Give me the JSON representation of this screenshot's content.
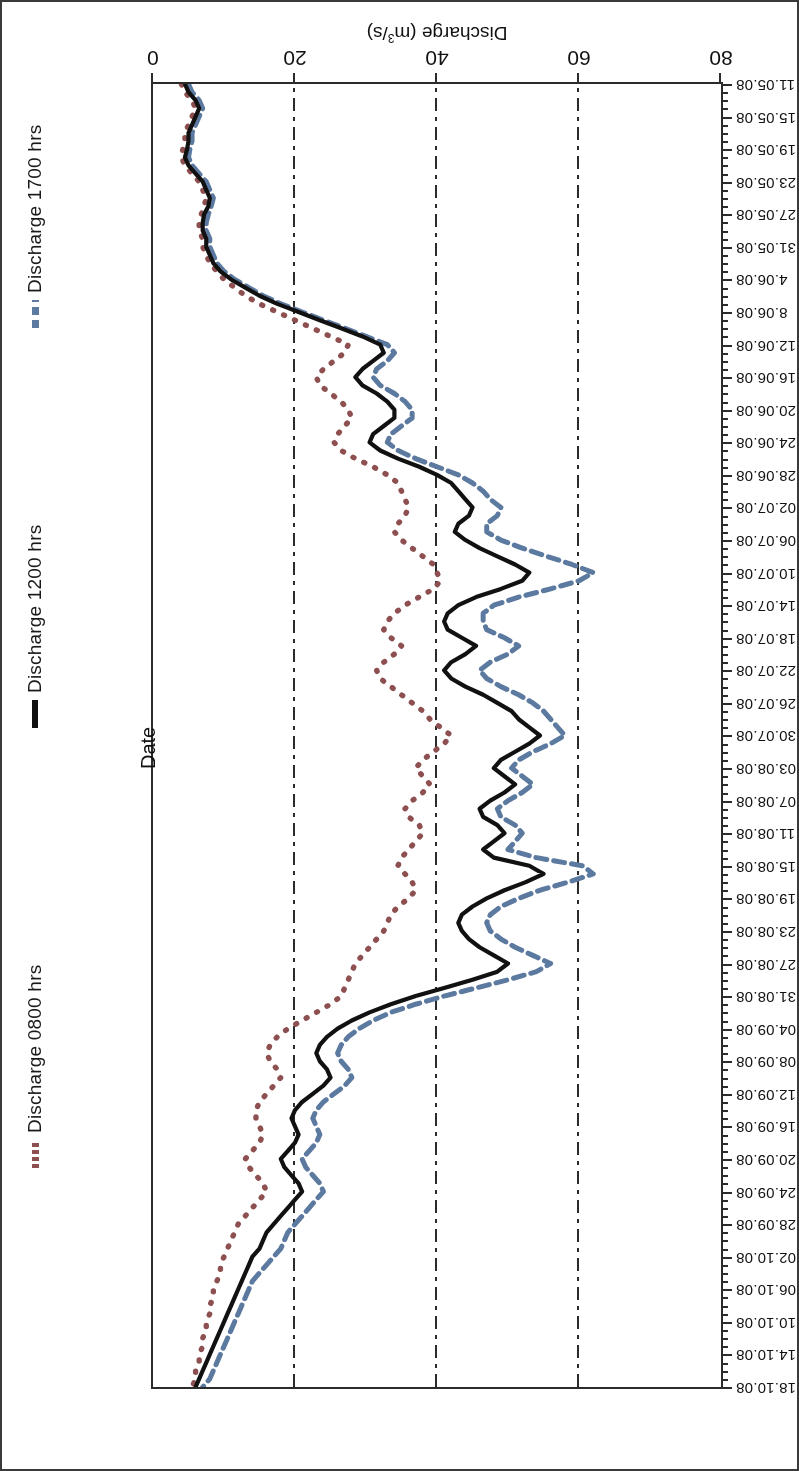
{
  "chart_data": {
    "type": "line",
    "title": "",
    "xlabel": "Date",
    "ylabel": "Discharge (m³/s)",
    "ylim": [
      0,
      80
    ],
    "yticks": [
      0,
      20,
      40,
      60,
      80
    ],
    "grid": true,
    "gridlines_at": [
      20,
      40,
      60
    ],
    "legend_position": "top",
    "orientation": "rotated-180",
    "x": [
      "11.05.08",
      "12.05.08",
      "13.05.08",
      "14.05.08",
      "15.05.08",
      "16.05.08",
      "17.05.08",
      "18.05.08",
      "19.05.08",
      "20.05.08",
      "21.05.08",
      "22.05.08",
      "23.05.08",
      "24.05.08",
      "25.05.08",
      "26.05.08",
      "27.05.08",
      "28.05.08",
      "29.05.08",
      "30.05.08",
      "31.05.08",
      "01.06.08",
      "02.06.08",
      "03.06.08",
      "04.06.08",
      "05.06.08",
      "06.06.08",
      "07.06.08",
      "08.06.08",
      "09.06.08",
      "10.06.08",
      "11.06.08",
      "12.06.08",
      "13.06.08",
      "14.06.08",
      "15.06.08",
      "16.06.08",
      "17.06.08",
      "18.06.08",
      "19.06.08",
      "20.06.08",
      "21.06.08",
      "22.06.08",
      "23.06.08",
      "24.06.08",
      "25.06.08",
      "26.06.08",
      "27.06.08",
      "28.06.08",
      "29.06.08",
      "30.06.08",
      "01.07.08",
      "02.07.08",
      "03.07.08",
      "04.07.08",
      "05.07.08",
      "06.07.08",
      "07.07.08",
      "08.07.08",
      "09.07.08",
      "10.07.08",
      "11.07.08",
      "12.07.08",
      "13.07.08",
      "14.07.08",
      "15.07.08",
      "16.07.08",
      "17.07.08",
      "18.07.08",
      "19.07.08",
      "20.07.08",
      "21.07.08",
      "22.07.08",
      "23.07.08",
      "24.07.08",
      "25.07.08",
      "26.07.08",
      "27.07.08",
      "28.07.08",
      "29.07.08",
      "30.07.08",
      "31.07.08",
      "01.08.08",
      "02.08.08",
      "03.08.08",
      "04.08.08",
      "05.08.08",
      "06.08.08",
      "07.08.08",
      "08.08.08",
      "09.08.08",
      "10.08.08",
      "11.08.08",
      "12.08.08",
      "13.08.08",
      "14.08.08",
      "15.08.08",
      "16.08.08",
      "17.08.08",
      "18.08.08",
      "19.08.08",
      "20.08.08",
      "21.08.08",
      "22.08.08",
      "23.08.08",
      "24.08.08",
      "25.08.08",
      "26.08.08",
      "27.08.08",
      "28.08.08",
      "29.08.08",
      "30.08.08",
      "31.08.08",
      "01.09.08",
      "02.09.08",
      "03.09.08",
      "04.09.08",
      "05.09.08",
      "06.09.08",
      "07.09.08",
      "08.09.08",
      "09.09.08",
      "10.09.08",
      "11.09.08",
      "12.09.08",
      "13.09.08",
      "14.09.08",
      "15.09.08",
      "16.09.08",
      "17.09.08",
      "18.09.08",
      "19.09.08",
      "20.09.08",
      "21.09.08",
      "22.09.08",
      "23.09.08",
      "24.09.08",
      "25.09.08",
      "26.09.08",
      "27.09.08",
      "28.09.08",
      "29.09.08",
      "30.09.08",
      "01.10.08",
      "02.10.08",
      "03.10.08",
      "04.10.08",
      "05.10.08",
      "06.10.08",
      "07.10.08",
      "08.10.08",
      "09.10.08",
      "10.10.08",
      "11.10.08",
      "12.10.08",
      "13.10.08",
      "14.10.08",
      "15.10.08",
      "16.10.08",
      "17.10.08",
      "18.10.08"
    ],
    "xtick_labels": [
      "11.05.08",
      "15.05.08",
      "19.05.08",
      "23.05.08",
      "27.05.08",
      "31.05.08",
      "4.06.08",
      "8.06.08",
      "12.06.08",
      "16.06.08",
      "20.06.08",
      "24.06.08",
      "28.06.08",
      "02.07.08",
      "06.07.08",
      "10.07.08",
      "14.07.08",
      "18.07.08",
      "22.07.08",
      "26.07.08",
      "30.07.08",
      "03.08.08",
      "07.08.08",
      "11.08.08",
      "15.08.08",
      "19.08.08",
      "23.08.08",
      "27.08.08",
      "31.08.08",
      "04.09.08",
      "08.09.08",
      "12.09.08",
      "16.09.08",
      "20.09.08",
      "24.09.08",
      "28.09.08",
      "02.10.08",
      "06.10.08",
      "10.10.08",
      "14.10.08",
      "18.10.08"
    ],
    "series": [
      {
        "name": "Discharge 0800 hrs",
        "color": "#8d4f4f",
        "style": "dotted",
        "values": [
          4.0,
          4.5,
          5.5,
          6.0,
          5.5,
          5.0,
          4.5,
          4.5,
          4.2,
          4.0,
          4.5,
          5.5,
          6.5,
          7.0,
          7.5,
          7.2,
          6.8,
          6.5,
          6.5,
          7.0,
          7.0,
          7.5,
          8.0,
          9.0,
          10.0,
          11.5,
          13.0,
          15.0,
          17.5,
          20.0,
          22.5,
          25.0,
          27.5,
          27.0,
          25.5,
          24.0,
          23.0,
          23.5,
          25.0,
          26.5,
          27.5,
          28.0,
          27.0,
          26.0,
          25.5,
          26.5,
          28.5,
          31.0,
          33.0,
          34.5,
          35.0,
          35.5,
          36.0,
          35.5,
          34.5,
          34.0,
          35.0,
          36.5,
          38.0,
          39.5,
          40.0,
          40.5,
          39.5,
          37.5,
          35.5,
          34.0,
          33.0,
          32.5,
          33.5,
          35.0,
          34.0,
          32.5,
          31.5,
          32.0,
          33.5,
          35.0,
          36.5,
          38.0,
          39.0,
          40.5,
          42.0,
          41.0,
          39.5,
          38.0,
          37.0,
          38.0,
          39.0,
          38.0,
          36.5,
          35.5,
          36.0,
          37.5,
          38.0,
          37.0,
          36.0,
          35.0,
          34.5,
          35.5,
          36.5,
          37.0,
          36.0,
          34.5,
          33.5,
          33.0,
          32.5,
          31.5,
          30.5,
          29.5,
          28.5,
          28.0,
          27.5,
          27.0,
          26.5,
          25.0,
          23.0,
          21.0,
          19.0,
          17.5,
          16.5,
          16.0,
          16.5,
          17.5,
          18.0,
          17.0,
          16.0,
          15.0,
          14.5,
          14.5,
          15.0,
          15.5,
          15.0,
          14.0,
          13.0,
          13.5,
          14.5,
          15.5,
          16.0,
          15.0,
          14.0,
          13.0,
          12.0,
          11.5,
          11.0,
          10.5,
          10.0,
          9.5,
          9.5,
          9.0,
          8.5,
          8.5,
          8.0,
          8.0,
          7.5,
          7.5,
          7.0,
          7.0,
          6.5,
          6.5,
          6.0,
          6.0,
          5.5
        ]
      },
      {
        "name": "Discharge 1200 hrs",
        "color": "#111111",
        "style": "solid",
        "values": [
          4.5,
          5.0,
          6.0,
          6.5,
          6.0,
          5.5,
          5.0,
          5.0,
          4.8,
          4.5,
          5.0,
          6.0,
          7.0,
          7.5,
          8.0,
          7.8,
          7.2,
          7.0,
          7.0,
          7.5,
          7.5,
          8.0,
          8.5,
          9.5,
          11.0,
          13.0,
          15.0,
          17.5,
          20.5,
          23.5,
          26.5,
          29.5,
          32.0,
          32.5,
          31.0,
          29.5,
          28.5,
          29.5,
          31.5,
          33.0,
          34.0,
          34.0,
          32.5,
          31.0,
          30.5,
          32.0,
          34.5,
          37.5,
          40.0,
          42.0,
          43.0,
          44.0,
          45.0,
          44.5,
          43.0,
          42.5,
          44.0,
          46.0,
          48.5,
          51.0,
          53.0,
          52.0,
          49.0,
          45.5,
          43.0,
          41.5,
          41.0,
          41.5,
          43.5,
          45.5,
          44.0,
          42.0,
          41.0,
          42.0,
          44.0,
          46.5,
          48.5,
          50.5,
          51.5,
          53.0,
          54.5,
          53.0,
          51.0,
          49.0,
          48.0,
          49.5,
          51.0,
          49.5,
          47.5,
          46.0,
          46.5,
          48.5,
          49.5,
          48.0,
          46.5,
          48.0,
          53.0,
          55.0,
          52.5,
          49.5,
          47.0,
          45.0,
          43.5,
          43.0,
          43.5,
          44.5,
          46.0,
          48.0,
          50.0,
          48.5,
          45.0,
          41.0,
          37.0,
          33.5,
          30.5,
          28.0,
          26.0,
          24.5,
          23.5,
          23.0,
          23.5,
          24.5,
          25.0,
          24.0,
          22.5,
          21.0,
          20.0,
          19.5,
          20.0,
          20.5,
          20.0,
          19.0,
          18.0,
          18.5,
          19.5,
          20.5,
          21.0,
          20.0,
          19.0,
          18.0,
          17.0,
          16.0,
          15.5,
          15.0,
          14.0,
          13.5,
          13.0,
          12.5,
          12.0,
          11.5,
          11.0,
          10.5,
          10.0,
          9.5,
          9.0,
          8.5,
          8.0,
          7.5,
          7.0,
          6.5,
          6.0
        ]
      },
      {
        "name": "Discharge 1700 hrs",
        "color": "#5c7aa0",
        "style": "dashed",
        "values": [
          5.0,
          5.5,
          6.5,
          7.0,
          6.5,
          6.0,
          5.5,
          5.5,
          5.2,
          5.0,
          5.5,
          6.5,
          7.5,
          8.0,
          8.5,
          8.2,
          7.8,
          7.5,
          7.5,
          8.0,
          8.0,
          8.5,
          9.0,
          10.0,
          11.5,
          13.5,
          15.5,
          18.0,
          21.0,
          24.0,
          27.0,
          30.0,
          33.0,
          34.0,
          33.0,
          31.5,
          31.0,
          32.0,
          34.0,
          35.5,
          36.5,
          36.5,
          35.0,
          33.5,
          33.0,
          34.5,
          37.0,
          40.0,
          43.0,
          45.0,
          46.5,
          47.5,
          49.0,
          48.5,
          47.0,
          47.0,
          49.0,
          52.0,
          55.5,
          59.0,
          62.0,
          60.0,
          56.0,
          51.5,
          48.0,
          46.5,
          46.5,
          47.0,
          49.5,
          51.5,
          50.0,
          47.5,
          46.0,
          47.0,
          49.0,
          51.5,
          53.5,
          55.0,
          56.0,
          57.0,
          58.0,
          56.0,
          53.5,
          51.5,
          50.5,
          52.0,
          53.5,
          52.0,
          50.0,
          48.5,
          49.0,
          51.0,
          52.0,
          51.0,
          50.0,
          54.0,
          60.5,
          62.0,
          58.5,
          54.5,
          51.5,
          49.0,
          47.5,
          47.0,
          47.5,
          49.0,
          51.0,
          53.5,
          56.0,
          54.0,
          50.0,
          45.5,
          41.0,
          37.0,
          33.5,
          31.0,
          29.0,
          27.5,
          26.5,
          26.0,
          26.5,
          27.5,
          28.0,
          27.0,
          25.5,
          24.0,
          23.0,
          22.5,
          23.0,
          23.5,
          23.0,
          22.0,
          21.0,
          21.5,
          22.5,
          23.5,
          24.0,
          23.0,
          22.0,
          21.0,
          20.0,
          19.0,
          18.5,
          18.0,
          17.0,
          16.0,
          15.0,
          14.0,
          13.5,
          13.0,
          12.5,
          12.0,
          11.5,
          11.0,
          10.5,
          10.0,
          9.5,
          9.0,
          8.5,
          8.0,
          7.0
        ]
      }
    ]
  },
  "legend": {
    "items": [
      {
        "label": "Discharge 0800 hrs",
        "color": "#8d4f4f",
        "style": "dotted"
      },
      {
        "label": "Discharge 1200 hrs",
        "color": "#111111",
        "style": "solid"
      },
      {
        "label": "Discharge 1700 hrs",
        "color": "#5c7aa0",
        "style": "dashed"
      }
    ]
  },
  "axes": {
    "value_axis_title": "Discharge (m³/s)",
    "value_axis_title_main": "Discharge (m",
    "value_axis_title_sup": "3",
    "value_axis_title_tail": "/s)",
    "date_axis_title": "Date"
  }
}
